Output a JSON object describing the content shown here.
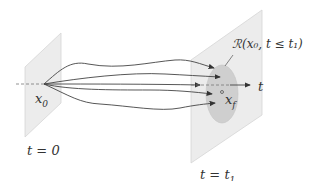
{
  "diagram": {
    "start_label": "x",
    "start_sub": "0",
    "start_time": "t = 0",
    "end_time": "t = t",
    "end_time_sub": "1",
    "axis_label": "t",
    "target_label": "x",
    "target_sub": "f",
    "reachable_set": "ℛ(x₀, t ≤ t₁)",
    "num_trajectories": 5,
    "colors": {
      "plane": "#e9e9e9",
      "plane_edge": "#cfcfcf",
      "region": "#cdcdcd",
      "line": "#444444"
    }
  }
}
